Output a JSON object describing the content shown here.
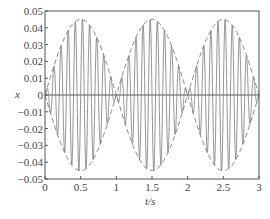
{
  "chart_data": {
    "type": "line",
    "title": "",
    "xlabel": "t/s",
    "ylabel": "x",
    "xlim": [
      0,
      3
    ],
    "ylim": [
      -0.05,
      0.05
    ],
    "grid": false,
    "xticks": [
      "0",
      "0.5",
      "1",
      "1.5",
      "2",
      "2.5",
      "3"
    ],
    "yticks": [
      "0.05",
      "0.04",
      "0.03",
      "0.02",
      "0.01",
      "0",
      "-0.01",
      "-0.02",
      "-0.03",
      "-0.04",
      "-0.05"
    ],
    "series": [
      {
        "name": "signal",
        "style": "solid",
        "formula": "0.045*sin(pi*t)*sin(20*pi*t)",
        "amplitude": 0.045,
        "carrier_hz": 10,
        "envelope_hz": 0.5
      },
      {
        "name": "envelope",
        "style": "dashed",
        "formula": "+/-0.045*|sin(pi*t)|",
        "peak_t": [
          0.5,
          1.5,
          2.5
        ],
        "peak_value": 0.045,
        "zero_t": [
          0,
          1,
          2,
          3
        ]
      }
    ]
  },
  "colors": {
    "line": "#777777",
    "axis": "#555555",
    "text": "#444444"
  }
}
